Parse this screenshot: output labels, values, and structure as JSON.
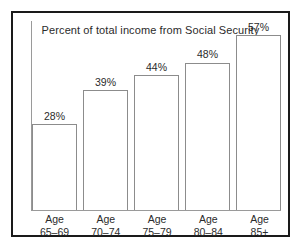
{
  "chart_data": {
    "type": "bar",
    "title": "Percent of total income from Social Security",
    "xlabel": "",
    "ylabel": "",
    "ylim": [
      0,
      62
    ],
    "grid": false,
    "legend": "none",
    "categories": [
      "Age 65–69",
      "Age 70–74",
      "Age 75–79",
      "Age 80–84",
      "Age 85+"
    ],
    "category_lines": [
      {
        "line1": "Age",
        "line2": "65–69"
      },
      {
        "line1": "Age",
        "line2": "70–74"
      },
      {
        "line1": "Age",
        "line2": "75–79"
      },
      {
        "line1": "Age",
        "line2": "80–84"
      },
      {
        "line1": "Age",
        "line2": "85+"
      }
    ],
    "values": [
      28,
      39,
      44,
      48,
      57
    ],
    "value_labels": [
      "28%",
      "39%",
      "44%",
      "48%",
      "57%"
    ],
    "colors": {
      "bar_fill": "#ffffff",
      "bar_stroke": "#8c8c8c",
      "axis": "#9a9a9a",
      "text": "#2b2b2b",
      "frame": "#1a1a1a",
      "background": "#ffffff"
    }
  }
}
